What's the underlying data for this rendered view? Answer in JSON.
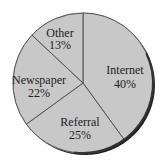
{
  "chart_data": {
    "type": "pie",
    "title": "",
    "categories": [
      "Internet",
      "Referral",
      "Newspaper",
      "Other"
    ],
    "values": [
      40,
      25,
      22,
      13
    ],
    "unit": "%",
    "start_angle": "top (12 o'clock)",
    "direction": "clockwise",
    "labels": [
      {
        "name": "Internet",
        "text": "40%"
      },
      {
        "name": "Referral",
        "text": "25%"
      },
      {
        "name": "Newspaper",
        "text": "22%"
      },
      {
        "name": "Other",
        "text": "13%"
      }
    ],
    "legend": "none (labels inside slices)",
    "colors": {
      "slice_fill": "#c8c8c8",
      "divider": "#555555",
      "outline": "#333333",
      "shadow": "#222222",
      "text": "#222222"
    }
  },
  "labels": {
    "internet": {
      "name": "Internet",
      "pct": "40%"
    },
    "referral": {
      "name": "Referral",
      "pct": "25%"
    },
    "newspaper": {
      "name": "Newspaper",
      "pct": "22%"
    },
    "other": {
      "name": "Other",
      "pct": "13%"
    }
  }
}
